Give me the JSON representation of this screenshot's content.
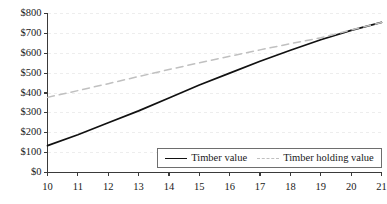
{
  "chart_data": {
    "type": "line",
    "title": "",
    "subtitle": "",
    "xlabel": "",
    "ylabel": "",
    "x": [
      10,
      11,
      12,
      13,
      14,
      15,
      16,
      17,
      18,
      19,
      20,
      21
    ],
    "xticklabels": [
      "10",
      "11",
      "12",
      "13",
      "14",
      "15",
      "16",
      "17",
      "18",
      "19",
      "20",
      "21"
    ],
    "yticklabels": [
      "$0",
      "$100",
      "$200",
      "$300",
      "$400",
      "$500",
      "$600",
      "$700",
      "$800"
    ],
    "yticks": [
      0,
      100,
      200,
      300,
      400,
      500,
      600,
      700,
      800
    ],
    "xlim": [
      10,
      21
    ],
    "ylim": [
      0,
      800
    ],
    "grid": "horizontal-dashed",
    "legend_position": "bottom-right-inside",
    "series": [
      {
        "name": "Timber value",
        "style": "solid",
        "color": "#111111",
        "values": [
          135,
          190,
          250,
          310,
          375,
          440,
          500,
          560,
          615,
          668,
          715,
          755
        ]
      },
      {
        "name": "Timber holding value",
        "style": "dashed",
        "color": "#c0c0c0",
        "values": [
          378,
          412,
          447,
          483,
          518,
          552,
          585,
          617,
          648,
          678,
          717,
          755
        ]
      }
    ],
    "annotations": []
  },
  "legend": {
    "entries": [
      {
        "label": "Timber value"
      },
      {
        "label": "Timber holding value"
      }
    ]
  },
  "colors": {
    "axis": "#3a3a3a",
    "grid": "#ededed",
    "series_solid": "#111111",
    "series_dashed": "#c0c0c0",
    "text": "#1a1a1a",
    "legend_border": "#6e6e6e",
    "background": "#ffffff"
  }
}
